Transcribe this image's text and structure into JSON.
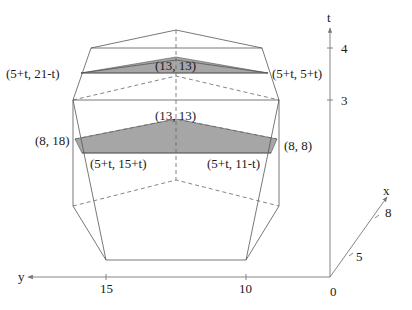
{
  "diagram": {
    "type": "3d-polytope-slices",
    "axes": {
      "t": {
        "label": "t",
        "ticks": [
          "3",
          "4"
        ]
      },
      "y": {
        "label": "y",
        "ticks": [
          "15",
          "10"
        ]
      },
      "x": {
        "label": "x",
        "ticks": [
          "5",
          "8"
        ]
      },
      "origin": "0"
    },
    "upper_slice": {
      "left_label": "(5+t, 21-t)",
      "right_label": "(5+t, 5+t)",
      "apex_label": "(13, 13)"
    },
    "lower_slice": {
      "apex_label": "(13, 13)",
      "left_label": "(8, 18)",
      "right_label": "(8, 8)",
      "bottom_left_label": "(5+t, 15+t)",
      "bottom_right_label": "(5+t, 11-t)"
    },
    "colors": {
      "shade": "#a6a6a6",
      "edge": "#555555",
      "axis": "#777777"
    }
  }
}
